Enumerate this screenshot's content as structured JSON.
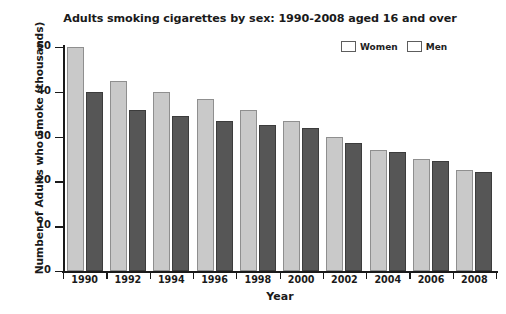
{
  "chart_data": {
    "type": "bar",
    "title": "Adults smoking cigarettes by sex: 1990-2008 aged 16 and over",
    "xlabel": "Year",
    "ylabel": "Number of Adults who Smoke (thousands)",
    "categories": [
      "1990",
      "1992",
      "1994",
      "1996",
      "1998",
      "2000",
      "2002",
      "2004",
      "2006",
      "2008"
    ],
    "series": [
      {
        "name": "Women",
        "color": "#c9c9c9",
        "values": [
          50,
          42.5,
          40,
          38.5,
          36,
          33.5,
          30,
          27,
          25,
          22.5
        ]
      },
      {
        "name": "Men",
        "color": "#565656",
        "values": [
          40,
          36,
          34.5,
          33.5,
          32.5,
          32,
          28.5,
          26.5,
          24.5,
          22
        ]
      }
    ],
    "ylim": [
      0,
      50
    ],
    "yticks": [
      0,
      10,
      20,
      30,
      40,
      50
    ],
    "ytick_labels": [
      "0",
      "10",
      "20",
      "30",
      "40",
      "50"
    ],
    "grid": false,
    "legend_position": "top-right"
  }
}
